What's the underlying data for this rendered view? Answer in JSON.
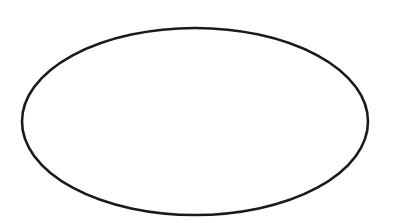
{
  "canvas": {
    "width": 400,
    "height": 223,
    "background": "#ffffff"
  },
  "shapes": [
    {
      "type": "ellipse",
      "cx": 195,
      "cy": 121.5,
      "rx": 173,
      "ry": 93.5,
      "stroke": "#1a1a1a",
      "stroke_width": 2.6,
      "fill": "none"
    }
  ]
}
